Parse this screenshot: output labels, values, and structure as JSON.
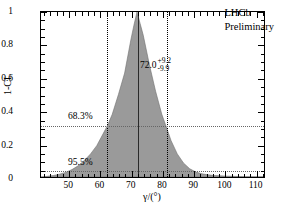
{
  "figure": {
    "experiment_line1": "LHCb",
    "experiment_line2": "Preliminary",
    "central_value": "72.0",
    "err_up": "+9.2",
    "err_down": "-9.9",
    "cl68_label": "68.3%",
    "cl95_label": "95.5%"
  },
  "chart_data": {
    "type": "line",
    "title": "",
    "subtitle": "",
    "xlabel": "γ/(°)",
    "ylabel": "1-CL",
    "xlim": [
      41,
      113
    ],
    "ylim": [
      0,
      1
    ],
    "grid": false,
    "legend": "none",
    "x_ticks": [
      50,
      60,
      70,
      80,
      90,
      100,
      110
    ],
    "x_tick_labels": [
      "50",
      "60",
      "70",
      "80",
      "90",
      "100",
      "110"
    ],
    "x_minor_step": 2,
    "y_ticks": [
      0,
      0.2,
      0.4,
      0.6,
      0.8,
      1
    ],
    "y_tick_labels": [
      "0",
      "0.2",
      "0.4",
      "0.6",
      "0.8",
      "1"
    ],
    "y_minor_step": 0.05,
    "series": [
      {
        "name": "1-CL",
        "fill": "#9a9a9a",
        "x": [
          41,
          43,
          45,
          47,
          49,
          51,
          53,
          55,
          57,
          59,
          61,
          62.6,
          64,
          66,
          68,
          70,
          71,
          72,
          73,
          74,
          76,
          78,
          80,
          81.2,
          83,
          85,
          87,
          89,
          91,
          93,
          95,
          97,
          99,
          101,
          103,
          105,
          107,
          109,
          111,
          113
        ],
        "y": [
          0.0,
          0.004,
          0.009,
          0.017,
          0.028,
          0.045,
          0.068,
          0.1,
          0.14,
          0.19,
          0.26,
          0.317,
          0.38,
          0.5,
          0.63,
          0.83,
          0.92,
          1.0,
          0.93,
          0.86,
          0.68,
          0.52,
          0.38,
          0.317,
          0.22,
          0.14,
          0.085,
          0.05,
          0.03,
          0.019,
          0.013,
          0.009,
          0.007,
          0.005,
          0.004,
          0.003,
          0.002,
          0.002,
          0.001,
          0.001
        ]
      }
    ],
    "annotations": [
      {
        "name": "best-fit-line",
        "type": "vline",
        "x": 72.0,
        "style": "solid"
      },
      {
        "name": "lower-68-line",
        "type": "vline",
        "x": 62.1,
        "style": "dotted"
      },
      {
        "name": "upper-68-line",
        "type": "vline",
        "x": 81.2,
        "style": "dotted"
      },
      {
        "name": "cl68-line",
        "type": "hline",
        "y": 0.317,
        "style": "dotted",
        "label": "68.3%"
      },
      {
        "name": "cl95-line",
        "type": "hline",
        "y": 0.045,
        "style": "dotted",
        "label": "95.5%"
      }
    ]
  }
}
